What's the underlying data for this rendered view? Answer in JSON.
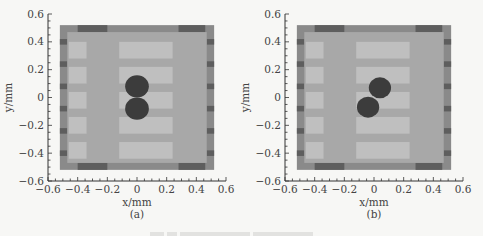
{
  "chart_data": [
    {
      "type": "heatmap",
      "panel": "(a)",
      "xlabel": "x/mm",
      "ylabel": "y/mm",
      "xlim": [
        -0.6,
        0.6
      ],
      "ylim": [
        -0.6,
        0.6
      ],
      "xticks": [
        "-0.6",
        "-0.4",
        "-0.2",
        "0",
        "0.2",
        "0.4",
        "0.6"
      ],
      "yticks": [
        "0.6",
        "0.4",
        "0.2",
        "0",
        "-0.2",
        "-0.4",
        "-0.6"
      ],
      "domain_extent": [
        -0.52,
        0.52
      ],
      "objects": [
        {
          "shape": "circle",
          "cx": 0.0,
          "cy": 0.08,
          "r": 0.08
        },
        {
          "shape": "circle",
          "cx": 0.0,
          "cy": -0.08,
          "r": 0.08
        }
      ]
    },
    {
      "type": "heatmap",
      "panel": "(b)",
      "xlabel": "x/mm",
      "ylabel": "y/mm",
      "xlim": [
        -0.6,
        0.6
      ],
      "ylim": [
        -0.6,
        0.6
      ],
      "xticks": [
        "-0.6",
        "-0.4",
        "-0.2",
        "0",
        "0.2",
        "0.4",
        "0.6"
      ],
      "yticks": [
        "0.6",
        "0.4",
        "0.2",
        "0",
        "-0.2",
        "-0.4",
        "-0.6"
      ],
      "domain_extent": [
        -0.52,
        0.52
      ],
      "objects": [
        {
          "shape": "circle",
          "cx": 0.04,
          "cy": 0.07,
          "r": 0.075
        },
        {
          "shape": "circle",
          "cx": -0.04,
          "cy": -0.07,
          "r": 0.075
        }
      ]
    }
  ],
  "panels": [
    {
      "label": "(a)",
      "xlabel": "x/mm",
      "ylabel": "y/mm"
    },
    {
      "label": "(b)",
      "xlabel": "x/mm",
      "ylabel": "y/mm"
    }
  ],
  "colors": {
    "border_dark": "#5e5e5e",
    "border_mid": "#8a8a8a",
    "field": "#a8a8a8",
    "stripe_light": "#c4c4c4",
    "circle": "#3c3c3c"
  }
}
